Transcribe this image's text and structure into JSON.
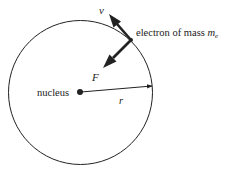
{
  "diagram": {
    "type": "bohr-atom-orbit",
    "labels": {
      "velocity": "v",
      "electron_prefix": "electron of mass ",
      "electron_mass_symbol": "m",
      "electron_mass_subscript": "e",
      "force": "F",
      "nucleus": "nucleus",
      "radius": "r"
    },
    "colors": {
      "stroke": "#222222",
      "background": "#ffffff"
    }
  }
}
